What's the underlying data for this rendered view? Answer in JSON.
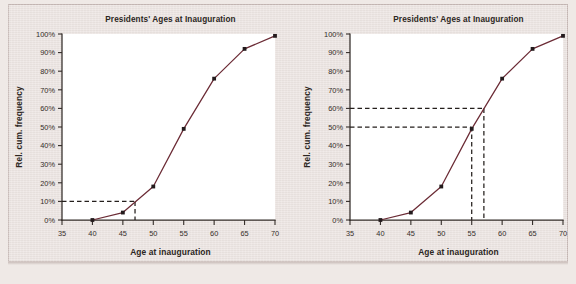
{
  "figure": {
    "background_color": "#efe9e6",
    "page_color": "#ece5e2",
    "plot_color": "#ffffff",
    "line_color": "#6b2b35",
    "guide_color": "#241f1c"
  },
  "chart_data": [
    {
      "id": "left",
      "type": "line",
      "title": "Presidents' Ages at Inauguration",
      "xlabel": "Age at inauguration",
      "ylabel": "Rel. cum. frequency",
      "x": [
        40,
        45,
        50,
        55,
        60,
        65,
        70
      ],
      "values": [
        0,
        4,
        18,
        49,
        76,
        92,
        99
      ],
      "point_labels": [
        "0%",
        "4%",
        "18%",
        "49%",
        "76%",
        "92%",
        "99%"
      ],
      "xlim": [
        35,
        70
      ],
      "ylim": [
        0,
        100
      ],
      "xticks": [
        35,
        40,
        45,
        50,
        55,
        60,
        65,
        70
      ],
      "xtick_labels": [
        "35",
        "40",
        "45",
        "50",
        "55",
        "60",
        "65",
        "70"
      ],
      "yticks": [
        0,
        10,
        20,
        30,
        40,
        50,
        60,
        70,
        80,
        90,
        100
      ],
      "ytick_labels": [
        "0%",
        "10%",
        "20%",
        "30%",
        "40%",
        "50%",
        "60%",
        "70%",
        "80%",
        "90%",
        "100%"
      ],
      "grid": false,
      "legend": false,
      "annotations": [
        {
          "kind": "guide",
          "style": "dashed",
          "description": "10th percentile read-off",
          "y_value": 10,
          "x_value": 47,
          "y_label": "10%",
          "x_label": "47"
        }
      ]
    },
    {
      "id": "right",
      "type": "line",
      "title": "Presidents' Ages at Inauguration",
      "xlabel": "Age at inauguration",
      "ylabel": "Rel. cum. frequency",
      "x": [
        40,
        45,
        50,
        55,
        60,
        65,
        70
      ],
      "values": [
        0,
        4,
        18,
        49,
        76,
        92,
        99
      ],
      "point_labels": [
        "0%",
        "4%",
        "18%",
        "49%",
        "76%",
        "92%",
        "99%"
      ],
      "xlim": [
        35,
        70
      ],
      "ylim": [
        0,
        100
      ],
      "xticks": [
        35,
        40,
        45,
        50,
        55,
        60,
        65,
        70
      ],
      "xtick_labels": [
        "35",
        "40",
        "45",
        "50",
        "55",
        "60",
        "65",
        "70"
      ],
      "yticks": [
        0,
        10,
        20,
        30,
        40,
        50,
        60,
        70,
        80,
        90,
        100
      ],
      "ytick_labels": [
        "0%",
        "10%",
        "20%",
        "30%",
        "40%",
        "50%",
        "60%",
        "70%",
        "80%",
        "90%",
        "100%"
      ],
      "grid": false,
      "legend": false,
      "annotations": [
        {
          "kind": "guide",
          "style": "dashed",
          "description": "median read-off",
          "y_value": 50,
          "x_value": 55,
          "y_label": "50%",
          "x_label": "55"
        },
        {
          "kind": "guide",
          "style": "dashed",
          "description": "60th percentile read-off",
          "y_value": 60,
          "x_value": 57,
          "y_label": "60%",
          "x_label": "57"
        }
      ]
    }
  ]
}
